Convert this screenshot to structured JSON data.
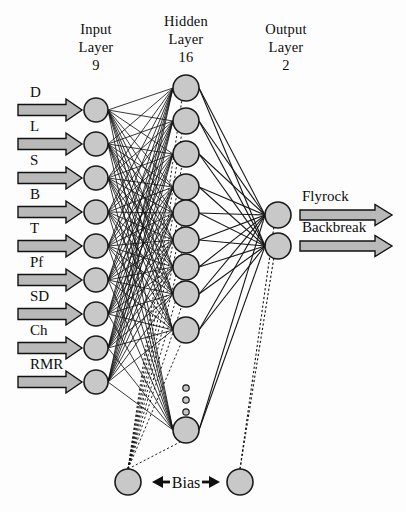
{
  "figure": {
    "kind": "neural-network-architecture",
    "background_color": "#fdfdfd",
    "node_fill": "#c8c8c8",
    "node_stroke": "#1a1a1a",
    "line_color": "#141414",
    "arrow_fill": "#b9b9b9"
  },
  "headers": {
    "input": {
      "line1": "Input",
      "line2": "Layer",
      "count": "9",
      "x": 96
    },
    "hidden": {
      "line1": "Hidden",
      "line2": "Layer",
      "count": "16",
      "x": 186
    },
    "output": {
      "line1": "Output",
      "line2": "Layer",
      "count": "2",
      "x": 286
    }
  },
  "layers": {
    "input": {
      "name": "input-layer",
      "cx": 96,
      "r": 12,
      "node_count": 9,
      "nodes": [
        {
          "label": "D",
          "cy": 110
        },
        {
          "label": "L",
          "cy": 144
        },
        {
          "label": "S",
          "cy": 178
        },
        {
          "label": "B",
          "cy": 212
        },
        {
          "label": "T",
          "cy": 246
        },
        {
          "label": "Pf",
          "cy": 280
        },
        {
          "label": "SD",
          "cy": 314
        },
        {
          "label": "Ch",
          "cy": 348
        },
        {
          "label": "RMR",
          "cy": 382
        }
      ]
    },
    "hidden": {
      "name": "hidden-layer",
      "cx": 186,
      "r": 13,
      "node_count": 16,
      "visible_nodes": [
        88,
        121,
        154,
        187,
        213,
        240,
        267,
        294,
        330,
        430
      ],
      "ellipsis": {
        "cx": 186,
        "dots_y": [
          388,
          400,
          412
        ],
        "r": 3.2
      }
    },
    "output": {
      "name": "output-layer",
      "cx": 278,
      "r": 13,
      "node_count": 2,
      "nodes": [
        {
          "label": "Flyrock",
          "cy": 215
        },
        {
          "label": "Backbreak",
          "cy": 246
        }
      ]
    },
    "bias": {
      "name": "bias-layer",
      "r": 13,
      "cy": 482,
      "label": "Bias",
      "label_x": 186,
      "left": {
        "cx": 128,
        "name": "bias-node-hidden"
      },
      "right": {
        "cx": 240,
        "name": "bias-node-output"
      }
    }
  },
  "input_arrows": {
    "x_start": 18,
    "x_tip": 82,
    "shaft_half": 5.5,
    "head_half": 11,
    "head_len": 16,
    "label_dy": -13
  },
  "output_arrows": {
    "x_start": 300,
    "x_tip": 392,
    "shaft_half": 5,
    "head_half": 10.5,
    "head_len": 17,
    "label_dy": -14
  }
}
